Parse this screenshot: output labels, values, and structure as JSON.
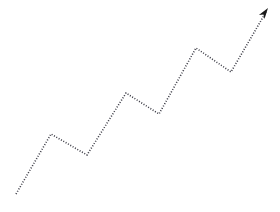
{
  "chart_data": {
    "type": "line",
    "title": "Upward Growth Trend Arrow",
    "subtitle": "",
    "xlabel": "",
    "ylabel": "",
    "grid": false,
    "legend": null,
    "legend_position": "none",
    "axis_visible": false,
    "tick_labels_x": [],
    "tick_labels_y": [],
    "xlim": [
      0,
      280
    ],
    "ylim": [
      212,
      0
    ],
    "annotations": [
      {
        "name": "arrow-head",
        "shape": "triangle",
        "x": 268,
        "y": 8,
        "direction": "up-right",
        "angle_deg": -55,
        "size": 11,
        "color": "#1a1a1a"
      }
    ],
    "series": [
      {
        "name": "trend",
        "line_style": "dotted",
        "line_width": 1.6,
        "dash_pattern": "1 1.7",
        "color": "#3a3a44",
        "marker": "none",
        "points": [
          {
            "x": 16,
            "y": 194,
            "label": "start"
          },
          {
            "x": 51,
            "y": 134,
            "label": "peak-1"
          },
          {
            "x": 87,
            "y": 155,
            "label": "valley-1"
          },
          {
            "x": 126,
            "y": 93,
            "label": "peak-2"
          },
          {
            "x": 159,
            "y": 114,
            "label": "valley-2"
          },
          {
            "x": 196,
            "y": 48,
            "label": "peak-3"
          },
          {
            "x": 231,
            "y": 72,
            "label": "valley-3"
          },
          {
            "x": 266,
            "y": 12,
            "label": "end-arrow"
          }
        ]
      }
    ]
  },
  "figure": {
    "background_color": "#ffffff",
    "width": 280,
    "height": 212,
    "alt_text": "Dotted zigzag line rising from lower left to upper right ending in an arrowhead"
  }
}
